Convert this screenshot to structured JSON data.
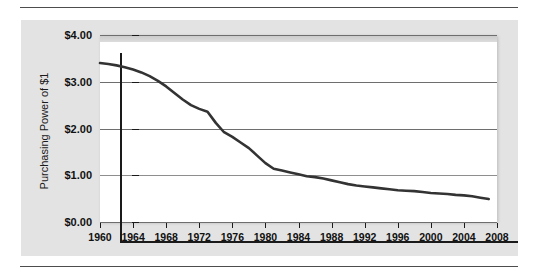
{
  "chart_data": {
    "type": "line",
    "title": "",
    "xlabel": "",
    "ylabel": "Purchasing Power of $1",
    "xlim": [
      1960,
      2008
    ],
    "ylim": [
      0,
      4
    ],
    "grid": true,
    "legend": "none",
    "y_tick_labels": [
      "$4.00",
      "$3.00",
      "$2.00",
      "$1.00",
      "$0.00"
    ],
    "y_tick_values": [
      4,
      3,
      2,
      1,
      0
    ],
    "x_tick_labels": [
      "1960",
      "1964",
      "1968",
      "1972",
      "1976",
      "1980",
      "1984",
      "1988",
      "1992",
      "1996",
      "2000",
      "2004",
      "2008"
    ],
    "x_tick_values": [
      1960,
      1964,
      1968,
      1972,
      1976,
      1980,
      1984,
      1988,
      1992,
      1996,
      2000,
      2004,
      2008
    ],
    "series": [
      {
        "name": "Purchasing Power of $1",
        "color": "#333333",
        "x": [
          1960,
          1961,
          1962,
          1963,
          1964,
          1965,
          1966,
          1967,
          1968,
          1969,
          1970,
          1971,
          1972,
          1973,
          1974,
          1975,
          1976,
          1977,
          1978,
          1979,
          1980,
          1981,
          1982,
          1983,
          1984,
          1985,
          1986,
          1987,
          1988,
          1989,
          1990,
          1991,
          1992,
          1993,
          1994,
          1995,
          1996,
          1997,
          1998,
          1999,
          2000,
          2001,
          2002,
          2003,
          2004,
          2005,
          2006,
          2007
        ],
        "values": [
          3.4,
          3.38,
          3.35,
          3.31,
          3.26,
          3.2,
          3.12,
          3.02,
          2.9,
          2.76,
          2.62,
          2.5,
          2.42,
          2.36,
          2.12,
          1.92,
          1.82,
          1.7,
          1.58,
          1.42,
          1.26,
          1.14,
          1.1,
          1.06,
          1.02,
          0.98,
          0.96,
          0.93,
          0.89,
          0.85,
          0.81,
          0.78,
          0.76,
          0.74,
          0.72,
          0.7,
          0.68,
          0.67,
          0.66,
          0.64,
          0.62,
          0.61,
          0.6,
          0.58,
          0.57,
          0.55,
          0.52,
          0.49
        ]
      }
    ]
  },
  "axis": {
    "y_title": "Purchasing Power of $1"
  },
  "colors": {
    "line": "#333333",
    "gridline": "#6e6e6e",
    "axis": "#1a1a1a",
    "container_bg": "#e3e3e3",
    "plot_bg": "#ffffff",
    "rule": "#4d4d4d"
  }
}
